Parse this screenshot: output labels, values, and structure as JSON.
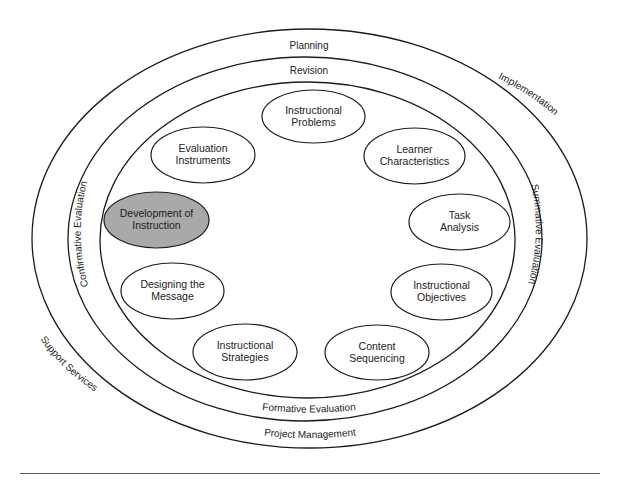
{
  "diagram": {
    "type": "nested-ellipse-process-model",
    "rings": {
      "outer": {
        "top_label": "Planning",
        "right_label": "Implementation",
        "left_label": "Support Services",
        "bottom_label": "Project Management"
      },
      "middle": {
        "top_label": "Revision",
        "right_label": "Summative Evaluation",
        "left_label": "Confirmative Evaluation",
        "bottom_label": "Formative Evaluation"
      }
    },
    "nodes": [
      {
        "id": "instructional-problems",
        "line1": "Instructional",
        "line2": "Problems",
        "highlighted": false
      },
      {
        "id": "learner-characteristics",
        "line1": "Learner",
        "line2": "Characteristics",
        "highlighted": false
      },
      {
        "id": "task-analysis",
        "line1": "Task",
        "line2": "Analysis",
        "highlighted": false
      },
      {
        "id": "instructional-objectives",
        "line1": "Instructional",
        "line2": "Objectives",
        "highlighted": false
      },
      {
        "id": "content-sequencing",
        "line1": "Content",
        "line2": "Sequencing",
        "highlighted": false
      },
      {
        "id": "instructional-strategies",
        "line1": "Instructional",
        "line2": "Strategies",
        "highlighted": false
      },
      {
        "id": "designing-the-message",
        "line1": "Designing the",
        "line2": "Message",
        "highlighted": false
      },
      {
        "id": "development-of-instruction",
        "line1": "Development of",
        "line2": "Instruction",
        "highlighted": true
      },
      {
        "id": "evaluation-instruments",
        "line1": "Evaluation",
        "line2": "Instruments",
        "highlighted": false
      }
    ],
    "colors": {
      "stroke": "#1c1c1c",
      "node_fill": "#ffffff",
      "highlight_fill": "#a9a9a9",
      "text": "#222222",
      "rule": "#555555"
    }
  }
}
